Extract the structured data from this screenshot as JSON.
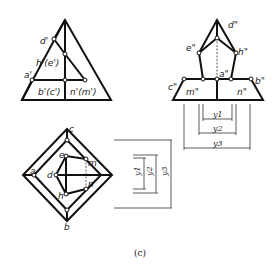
{
  "figure": {
    "caption": "(c)",
    "front_view": {
      "labels": {
        "d": "d'",
        "he": "h'(e')",
        "a": "a'",
        "bc": "b'(c')",
        "nm": "n'(m')"
      }
    },
    "side_view": {
      "labels": {
        "d": "d\"",
        "e": "e\"",
        "h": "h\"",
        "a": "a\"",
        "c": "c\"",
        "b": "b\"",
        "m": "m\"",
        "n": "n\""
      },
      "dimensions": [
        "y1",
        "y2",
        "y3"
      ]
    },
    "top_view": {
      "labels": {
        "c": "c",
        "a": "a",
        "e": "e",
        "m": "m",
        "d": "d",
        "n": "n",
        "h": "h",
        "b": "b"
      },
      "dimensions": [
        "y1",
        "y2",
        "y3"
      ]
    }
  }
}
